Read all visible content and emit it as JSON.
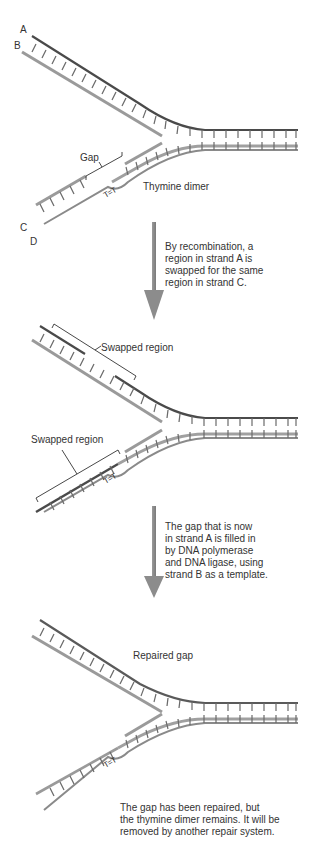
{
  "panels": [
    {
      "id": "initial",
      "strand_labels": {
        "a": "A",
        "b": "B",
        "c": "C",
        "d": "D"
      },
      "labels": {
        "gap": "Gap",
        "thymine_dimer": "Thymine dimer",
        "dimer_glyph": "T=T"
      }
    },
    {
      "id": "recombination",
      "labels": {
        "swapped_top": "Swapped region",
        "swapped_bottom": "Swapped region",
        "dimer_glyph": "T=T"
      }
    },
    {
      "id": "repaired",
      "labels": {
        "repaired_gap": "Repaired gap",
        "dimer_glyph": "T=T"
      }
    }
  ],
  "steps": [
    {
      "text": "By recombination, a\nregion in strand A is\nswapped for the same\nregion in strand C."
    },
    {
      "text": "The gap that is now\nin strand A is filled in\nby DNA polymerase\nand DNA ligase, using\nstrand B as a template."
    }
  ],
  "final_caption": "The gap has been repaired, but\nthe thymine dimer remains. It will be\nremoved by another repair system.",
  "colors": {
    "dark_strand": "#4a4a4a",
    "light_strand": "#9a9a9a",
    "rung": "#6a6a6a",
    "arrow": "#8c8c8c",
    "text": "#333333"
  }
}
